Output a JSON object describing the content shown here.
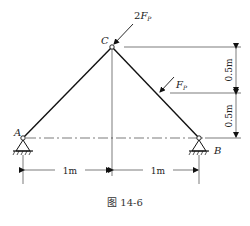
{
  "figure": {
    "caption": "图 14-6",
    "nodes": {
      "A": {
        "label": "A"
      },
      "B": {
        "label": "B"
      },
      "C": {
        "label": "C"
      }
    },
    "loads": {
      "top": {
        "label_coef": "2",
        "label_F": "F",
        "label_sub": "P"
      },
      "side": {
        "label_F": "F",
        "label_sub": "P"
      }
    },
    "dimensions": {
      "horizontal_left": "1m",
      "horizontal_right": "1m",
      "vertical_top": "0.5m",
      "vertical_bottom": "0.5m"
    }
  }
}
